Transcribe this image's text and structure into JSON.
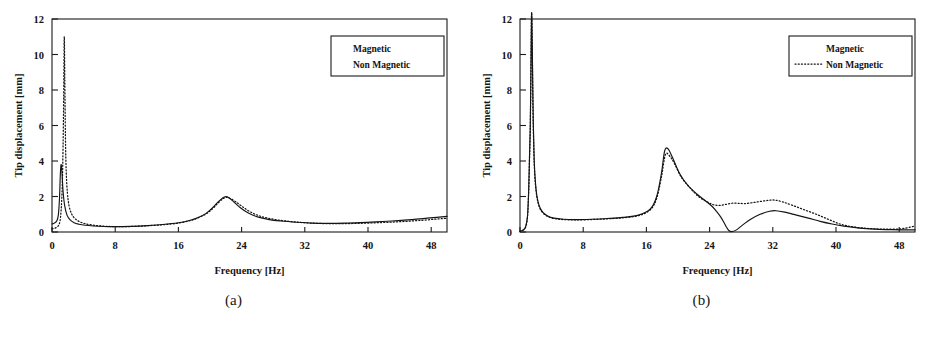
{
  "figure": {
    "panels": [
      {
        "id": "a",
        "caption": "(a)"
      },
      {
        "id": "b",
        "caption": "(b)"
      }
    ]
  },
  "chart_data": [
    {
      "panel": "a",
      "type": "line",
      "title": "",
      "xlabel": "Frequency [Hz]",
      "ylabel": "Tip displacement [mm]",
      "xlim": [
        0,
        50
      ],
      "ylim": [
        0,
        12
      ],
      "xticks": [
        0,
        8,
        16,
        24,
        32,
        40,
        48
      ],
      "yticks": [
        0,
        2,
        4,
        6,
        8,
        10,
        12
      ],
      "grid": false,
      "legend_position": "top-right",
      "legend": [
        "Magnetic",
        "Non Magnetic"
      ],
      "series": [
        {
          "name": "Magnetic",
          "style": "solid",
          "x": [
            0.0,
            0.3,
            0.6,
            0.8,
            0.95,
            1.05,
            1.15,
            1.25,
            1.4,
            1.6,
            1.9,
            2.3,
            2.8,
            3.4,
            4.2,
            5.2,
            6.5,
            8.0,
            10.0,
            12.0,
            14.0,
            16.0,
            17.5,
            18.5,
            19.5,
            20.3,
            21.0,
            21.6,
            22.0,
            22.4,
            23.0,
            23.8,
            24.8,
            26.0,
            27.5,
            29.0,
            31.0,
            33.0,
            35.0,
            37.0,
            39.0,
            41.0,
            43.0,
            45.0,
            47.0,
            49.0,
            50.0
          ],
          "y": [
            0.45,
            0.5,
            0.62,
            0.95,
            1.9,
            3.2,
            3.8,
            3.4,
            2.3,
            1.5,
            0.95,
            0.68,
            0.52,
            0.44,
            0.38,
            0.34,
            0.31,
            0.3,
            0.32,
            0.36,
            0.42,
            0.52,
            0.66,
            0.82,
            1.05,
            1.35,
            1.68,
            1.92,
            2.0,
            1.93,
            1.7,
            1.38,
            1.08,
            0.85,
            0.7,
            0.62,
            0.55,
            0.5,
            0.49,
            0.5,
            0.53,
            0.57,
            0.62,
            0.68,
            0.75,
            0.84,
            0.88
          ]
        },
        {
          "name": "Non Magnetic",
          "style": "dotted",
          "x": [
            0.0,
            0.4,
            0.8,
            1.0,
            1.15,
            1.3,
            1.4,
            1.48,
            1.55,
            1.62,
            1.7,
            1.8,
            1.95,
            2.15,
            2.45,
            2.85,
            3.4,
            4.1,
            5.0,
            6.2,
            8.0,
            10.0,
            12.0,
            14.0,
            16.0,
            17.5,
            18.5,
            19.5,
            20.3,
            21.0,
            21.6,
            22.0,
            22.5,
            23.2,
            24.0,
            25.0,
            26.3,
            28.0,
            30.0,
            32.0,
            34.0,
            36.5,
            39.0,
            41.5,
            44.0,
            46.5,
            49.0,
            50.0
          ],
          "y": [
            0.18,
            0.22,
            0.35,
            0.6,
            1.2,
            2.6,
            4.8,
            7.6,
            11.0,
            8.6,
            5.4,
            3.4,
            2.2,
            1.5,
            1.05,
            0.78,
            0.6,
            0.48,
            0.4,
            0.34,
            0.3,
            0.31,
            0.35,
            0.41,
            0.5,
            0.64,
            0.8,
            1.02,
            1.3,
            1.62,
            1.86,
            1.95,
            1.9,
            1.72,
            1.46,
            1.16,
            0.9,
            0.72,
            0.6,
            0.52,
            0.48,
            0.47,
            0.49,
            0.53,
            0.58,
            0.65,
            0.74,
            0.78
          ]
        }
      ]
    },
    {
      "panel": "b",
      "type": "line",
      "title": "",
      "xlabel": "Frequency [Hz]",
      "ylabel": "Tip displacement [mm]",
      "xlim": [
        0,
        50
      ],
      "ylim": [
        0,
        12
      ],
      "xticks": [
        0,
        8,
        16,
        24,
        32,
        40,
        48
      ],
      "yticks": [
        0,
        2,
        4,
        6,
        8,
        10,
        12
      ],
      "grid": false,
      "legend_position": "top-right",
      "legend": [
        "Magnetic",
        "Non Magnetic"
      ],
      "series": [
        {
          "name": "Magnetic",
          "style": "solid",
          "x": [
            0.0,
            0.35,
            0.7,
            0.95,
            1.1,
            1.2,
            1.3,
            1.38,
            1.45,
            1.5,
            1.58,
            1.68,
            1.8,
            1.95,
            2.15,
            2.45,
            2.9,
            3.5,
            4.3,
            5.5,
            7.0,
            9.0,
            11.0,
            13.0,
            15.0,
            16.5,
            17.3,
            17.9,
            18.3,
            18.7,
            19.3,
            20.2,
            21.3,
            22.5,
            23.5,
            24.3,
            24.9,
            25.4,
            25.8,
            26.1,
            26.4,
            26.8,
            27.4,
            28.2,
            29.2,
            30.4,
            31.6,
            32.4,
            33.5,
            35.0,
            36.5,
            38.0,
            39.5,
            41.0,
            43.0,
            45.0,
            47.0,
            49.0,
            50.0
          ],
          "y": [
            0.05,
            0.1,
            0.28,
            0.9,
            2.4,
            4.2,
            6.0,
            9.0,
            12.0,
            12.0,
            9.5,
            6.2,
            4.0,
            2.8,
            2.0,
            1.45,
            1.1,
            0.9,
            0.78,
            0.72,
            0.7,
            0.72,
            0.76,
            0.82,
            0.95,
            1.3,
            2.0,
            3.3,
            4.55,
            4.7,
            4.2,
            3.3,
            2.6,
            2.1,
            1.75,
            1.45,
            1.15,
            0.85,
            0.55,
            0.3,
            0.1,
            0.02,
            0.12,
            0.4,
            0.72,
            1.0,
            1.17,
            1.2,
            1.12,
            0.95,
            0.78,
            0.6,
            0.45,
            0.33,
            0.22,
            0.16,
            0.13,
            0.12,
            0.12
          ]
        },
        {
          "name": "Non Magnetic",
          "style": "dotted",
          "x": [
            0.0,
            0.35,
            0.7,
            0.95,
            1.1,
            1.2,
            1.3,
            1.38,
            1.45,
            1.5,
            1.58,
            1.68,
            1.8,
            1.95,
            2.15,
            2.45,
            2.9,
            3.5,
            4.3,
            5.5,
            7.0,
            9.0,
            11.0,
            13.0,
            15.0,
            16.5,
            17.3,
            17.9,
            18.4,
            18.9,
            19.5,
            20.4,
            21.5,
            22.6,
            23.6,
            24.4,
            25.2,
            26.0,
            26.8,
            27.6,
            28.4,
            29.4,
            30.4,
            31.4,
            32.2,
            33.2,
            34.5,
            36.0,
            37.5,
            39.0,
            40.5,
            42.0,
            44.0,
            46.0,
            48.0,
            49.5,
            50.0
          ],
          "y": [
            0.04,
            0.09,
            0.26,
            0.85,
            2.3,
            4.0,
            5.8,
            8.8,
            12.0,
            12.0,
            9.2,
            6.0,
            3.9,
            2.7,
            1.95,
            1.4,
            1.08,
            0.88,
            0.76,
            0.7,
            0.68,
            0.7,
            0.74,
            0.8,
            0.92,
            1.25,
            1.9,
            3.1,
            4.35,
            4.3,
            3.9,
            3.1,
            2.5,
            2.0,
            1.72,
            1.55,
            1.5,
            1.55,
            1.62,
            1.62,
            1.6,
            1.65,
            1.72,
            1.78,
            1.8,
            1.7,
            1.5,
            1.25,
            1.0,
            0.72,
            0.45,
            0.3,
            0.2,
            0.16,
            0.17,
            0.28,
            0.35
          ]
        }
      ]
    }
  ]
}
